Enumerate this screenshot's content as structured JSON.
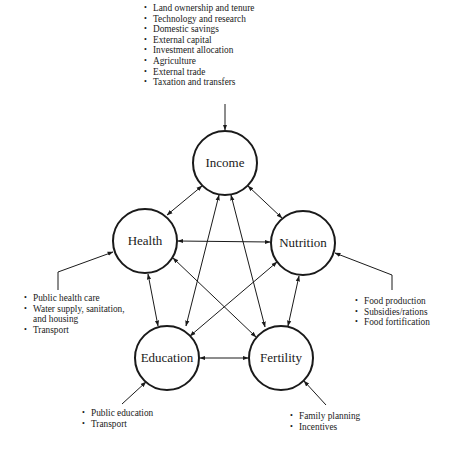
{
  "nodes": {
    "income": {
      "label": "Income",
      "cx": 225,
      "cy": 163,
      "r": 32
    },
    "health": {
      "label": "Health",
      "cx": 145,
      "cy": 241,
      "r": 32
    },
    "nutrition": {
      "label": "Nutrition",
      "cx": 303,
      "cy": 243,
      "r": 32
    },
    "education": {
      "label": "Education",
      "cx": 167,
      "cy": 358,
      "r": 32
    },
    "fertility": {
      "label": "Fertility",
      "cx": 281,
      "cy": 358,
      "r": 32
    }
  },
  "edges": [
    {
      "from": "income",
      "to": "health",
      "direction": "both"
    },
    {
      "from": "income",
      "to": "nutrition",
      "direction": "both"
    },
    {
      "from": "income",
      "to": "education",
      "direction": "both"
    },
    {
      "from": "income",
      "to": "fertility",
      "direction": "both"
    },
    {
      "from": "health",
      "to": "nutrition",
      "direction": "both"
    },
    {
      "from": "health",
      "to": "education",
      "direction": "both"
    },
    {
      "from": "health",
      "to": "fertility",
      "direction": "both"
    },
    {
      "from": "nutrition",
      "to": "education",
      "direction": "both"
    },
    {
      "from": "nutrition",
      "to": "fertility",
      "direction": "both"
    },
    {
      "from": "education",
      "to": "fertility",
      "direction": "both"
    }
  ],
  "inputs": {
    "income": {
      "items": [
        "Land ownership and tenure",
        "Technology and research",
        "Domestic savings",
        "External capital",
        "Investment allocation",
        "Agriculture",
        "External trade",
        "Taxation and transfers"
      ]
    },
    "health": {
      "items": [
        "Public health care",
        "Water supply, sanitation,",
        "and housing",
        "Transport"
      ]
    },
    "nutrition": {
      "items": [
        "Food production",
        "Subsidies/rations",
        "Food fortification"
      ]
    },
    "education": {
      "items": [
        "Public education",
        "Transport"
      ]
    },
    "fertility": {
      "items": [
        "Family planning",
        "Incentives"
      ]
    }
  },
  "colors": {
    "stroke": "#1a1a1a",
    "background": "#ffffff"
  }
}
